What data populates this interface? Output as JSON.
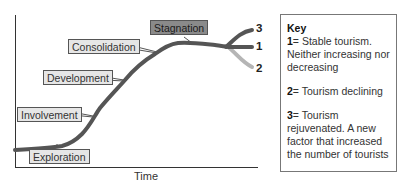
{
  "diagram": {
    "x_axis_label": "Time",
    "stages": [
      {
        "label": "Exploration",
        "style": "light"
      },
      {
        "label": "Involvement",
        "style": "light"
      },
      {
        "label": "Development",
        "style": "light"
      },
      {
        "label": "Consolidation",
        "style": "light"
      },
      {
        "label": "Stagnation",
        "style": "dark"
      }
    ],
    "branches": [
      {
        "id": "3",
        "meaning": "rejuvenated",
        "color": "#555555"
      },
      {
        "id": "1",
        "meaning": "stable",
        "color": "#555555"
      },
      {
        "id": "2",
        "meaning": "declining",
        "color": "#b5b5b5"
      }
    ],
    "colors": {
      "curve": "#555555",
      "decline_branch": "#b5b5b5",
      "label_fill": "#e6e6e6",
      "stagnation_fill": "#8a8a8a"
    }
  },
  "key": {
    "title": "Key",
    "items": [
      {
        "num": "1",
        "text": "= Stable tourism. Neither increasing nor decreasing"
      },
      {
        "num": "2",
        "text": "= Tourism declining"
      },
      {
        "num": "3",
        "text": "= Tourism rejuvenated. A new factor that increased the number of tourists"
      }
    ]
  }
}
